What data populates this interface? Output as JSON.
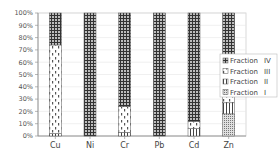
{
  "chart_data": {
    "type": "bar",
    "stacked": true,
    "percent": true,
    "title": "",
    "xlabel": "",
    "ylabel": "",
    "ylim": [
      0,
      100
    ],
    "yticks": [
      "0%",
      "10%",
      "20%",
      "30%",
      "40%",
      "50%",
      "60%",
      "70%",
      "80%",
      "90%",
      "100%"
    ],
    "categories": [
      "Cu",
      "Ni",
      "Cr",
      "Pb",
      "Cd",
      "Zn"
    ],
    "series": [
      {
        "name": "Fraction I",
        "pattern": "fine-dots",
        "values": [
          0,
          0,
          0,
          0,
          0,
          18
        ]
      },
      {
        "name": "Fraction II",
        "pattern": "vertical-lines",
        "values": [
          2,
          0,
          3,
          0,
          6,
          9
        ]
      },
      {
        "name": "Fraction III",
        "pattern": "dashes",
        "values": [
          72,
          0,
          21,
          0,
          6,
          18
        ]
      },
      {
        "name": "Fraction IV",
        "pattern": "grid",
        "values": [
          26,
          100,
          76,
          100,
          88,
          55
        ]
      }
    ],
    "legend_order": [
      "Fraction IV",
      "Fraction III",
      "Fraction II",
      "Fraction I"
    ],
    "legend_position": "right",
    "grid": true
  }
}
